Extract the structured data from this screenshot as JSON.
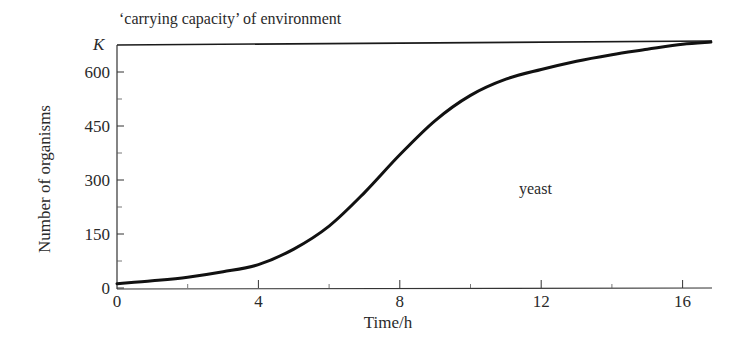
{
  "chart_data": {
    "type": "line",
    "title": "",
    "xlabel": "Time/h",
    "ylabel": "Number of organisms",
    "xlim": [
      0,
      16.8
    ],
    "ylim": [
      0,
      690
    ],
    "grid": false,
    "legend": "none",
    "x_ticks": [
      0,
      4,
      8,
      12,
      16
    ],
    "x_minor_ticks": [
      2,
      6,
      10,
      14
    ],
    "y_ticks": [
      0,
      150,
      300,
      450,
      600
    ],
    "y_minor_ticks": [
      75,
      225,
      375,
      525
    ],
    "series": [
      {
        "name": "yeast",
        "x": [
          0,
          1,
          2,
          3,
          4,
          5,
          6,
          7,
          8,
          9,
          10,
          11,
          12,
          13,
          14,
          15,
          16,
          16.8
        ],
        "values": [
          12,
          20,
          30,
          45,
          65,
          108,
          172,
          265,
          370,
          465,
          535,
          580,
          607,
          630,
          648,
          663,
          677,
          683
        ]
      }
    ],
    "reference_lines": [
      {
        "label": "K",
        "y": 683,
        "annotation": "'carrying capacity' of environment"
      }
    ],
    "annotations": [
      {
        "text": "yeast",
        "x": 12,
        "y": 270
      },
      {
        "text": "'carrying capacity' of environment",
        "position": "above K line"
      }
    ]
  },
  "labels": {
    "k_line_caption": "‘carrying capacity’ of environment",
    "k_symbol": "K",
    "series_label": "yeast",
    "x_axis_title": "Time/h",
    "y_axis_title": "Number of organisms"
  },
  "colors": {
    "ink": "#1a1a1a",
    "text": "#2a2a2a",
    "background": "#ffffff"
  }
}
